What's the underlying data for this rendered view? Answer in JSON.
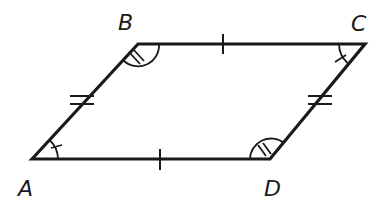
{
  "diagram": {
    "type": "parallelogram",
    "stroke_color": "#1a1a1a",
    "vertices": {
      "A": {
        "label": "A",
        "x": 32,
        "y": 159
      },
      "B": {
        "label": "B",
        "x": 138,
        "y": 44
      },
      "C": {
        "label": "C",
        "x": 365,
        "y": 44
      },
      "D": {
        "label": "D",
        "x": 270,
        "y": 159
      }
    },
    "labels": {
      "A": "A",
      "B": "B",
      "C": "C",
      "D": "D"
    },
    "side_marks": {
      "AB": "double-tick",
      "CD": "double-tick",
      "BC": "single-tick",
      "AD": "single-tick"
    },
    "angle_marks": {
      "A": "single-arc-single-tick",
      "C": "single-arc-single-tick",
      "B": "single-arc-double-tick",
      "D": "single-arc-double-tick"
    }
  }
}
